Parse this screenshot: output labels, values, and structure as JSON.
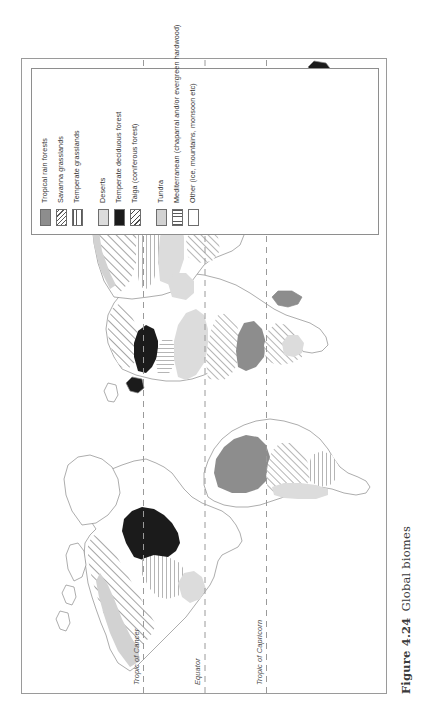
{
  "caption": {
    "number": "Figure 4.24",
    "text": "Global biomes"
  },
  "latitude_lines": [
    {
      "label": "Tropic of Cancer",
      "y_frac": 0.332
    },
    {
      "label": "Equator",
      "y_frac": 0.5
    },
    {
      "label": "Tropic of Capricorn",
      "y_frac": 0.668
    }
  ],
  "legend": {
    "groups": [
      {
        "name": "group-1",
        "items": [
          {
            "label": "Tropical rain forests",
            "pattern": "solid-gray",
            "swatch_class": "sw-solidgray"
          },
          {
            "label": "Savanna grasslands",
            "pattern": "diagonal-hatch",
            "swatch_class": "sw-diaghatch"
          },
          {
            "label": "Temperate grasslands",
            "pattern": "horizontal-lines",
            "swatch_class": "sw-horiz"
          }
        ]
      },
      {
        "name": "group-2",
        "items": [
          {
            "label": "Deserts",
            "pattern": "light-gray",
            "swatch_class": "sw-lightgray"
          },
          {
            "label": "Temperate deciduous forest",
            "pattern": "solid-black",
            "swatch_class": "sw-black"
          },
          {
            "label": "Taiga (coniferous forest)",
            "pattern": "diagonal-hatch",
            "swatch_class": "sw-taiga"
          }
        ]
      },
      {
        "name": "group-3",
        "items": [
          {
            "label": "Tundra",
            "pattern": "light-gray",
            "swatch_class": "sw-tundra"
          },
          {
            "label": "Mediterranean (chaparral and/or evergreen hardwood)",
            "pattern": "vertical-lines",
            "swatch_class": "sw-vert"
          },
          {
            "label": "Other (ice, mountains, monsoon etc)",
            "pattern": "white",
            "swatch_class": "sw-white"
          }
        ]
      }
    ]
  },
  "map": {
    "title": "Global biomes world map",
    "projection": "world-outline",
    "colors": {
      "coastline": "#8a8a8a",
      "tropical_rain_forest": "#8d8d8d",
      "desert": "#dcdcdc",
      "deciduous_forest": "#1b1b1b",
      "tundra": "#d2d2d2",
      "background": "#ffffff",
      "latitude_line": "#9a9a9a",
      "frame": "#9a9a9a"
    }
  }
}
